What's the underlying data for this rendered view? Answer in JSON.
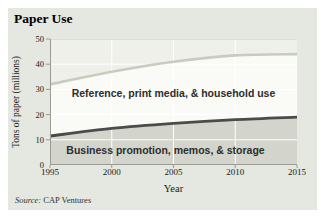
{
  "title": "Paper Use",
  "source": {
    "prefix": "Source:",
    "text": "CAP Ventures"
  },
  "colors": {
    "page_bg": "#ffffff",
    "card_bg": "#e5e7e1",
    "plot_bg": "#eff0ea",
    "axis": "#9b9b94",
    "grid": "#ffffff",
    "plot_top_edge": "#dcded6",
    "text": "#1a1a1a"
  },
  "chart_data": {
    "type": "area",
    "stacked": true,
    "title": "Paper Use",
    "xlabel": "Year",
    "ylabel": "Tons of paper (millions)",
    "xlim": [
      1995,
      2015
    ],
    "ylim": [
      0,
      50
    ],
    "xticks": [
      1995,
      2000,
      2005,
      2010,
      2015
    ],
    "yticks": [
      0,
      10,
      20,
      30,
      40,
      50
    ],
    "grid_horizontal_at": [
      10,
      20,
      30,
      40
    ],
    "grid_vertical_at": [
      2000,
      2005,
      2010
    ],
    "x": [
      1995,
      2000,
      2005,
      2010,
      2015
    ],
    "series": [
      {
        "name": "Business promotion, memos, & storage",
        "boundary_line": [
          11.5,
          14.5,
          16.5,
          18,
          19
        ],
        "band_values": [
          11.5,
          14.5,
          16.5,
          18,
          19
        ],
        "fill": "#d3d5cd",
        "line_color": "#4b4b4b"
      },
      {
        "name": "Reference, print media, & household use",
        "boundary_line": [
          32,
          37,
          41,
          43.5,
          44
        ],
        "band_values": [
          20.5,
          22.5,
          24.5,
          25.5,
          25
        ],
        "fill": "#fafaf6",
        "line_color": "#c7ccc0"
      }
    ],
    "legend": "labels drawn inside bands",
    "source": "Source: CAP Ventures"
  }
}
